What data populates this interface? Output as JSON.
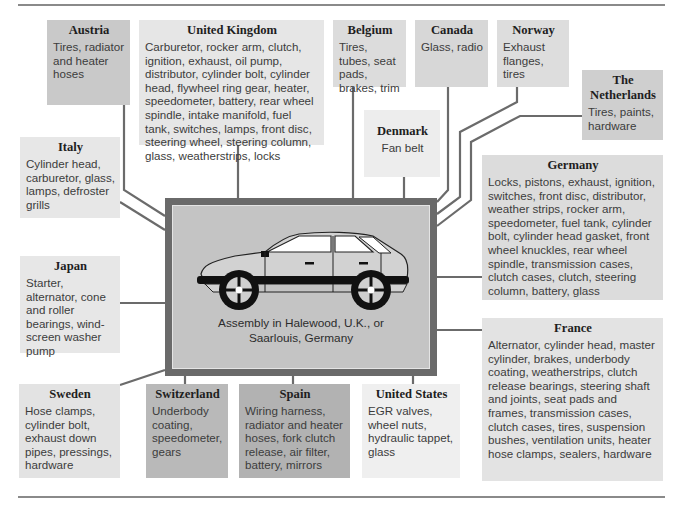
{
  "diagram": {
    "type": "supplier-map",
    "center": {
      "illustration": "hatchback-car",
      "caption_line1": "Assembly in Halewood, U.K., or",
      "caption_line2": "Saarlouis, Germany"
    },
    "suppliers": [
      {
        "id": "austria",
        "country": "Austria",
        "parts": "Tires, radiator and heater hoses",
        "shade": "#c9c9c9"
      },
      {
        "id": "uk",
        "country": "United Kingdom",
        "parts": "Carburetor, rocker arm, clutch, ignition, exhaust, oil pump, distributor, cylinder bolt, cylinder head, flywheel ring gear, heater, speedometer, battery, rear wheel spindle, intake manifold, fuel tank, switches, lamps, front disc, steering wheel, steering column, glass, weatherstrips, locks",
        "shade": "#e6e6e6"
      },
      {
        "id": "belgium",
        "country": "Belgium",
        "parts": "Tires, tubes, seat pads, brakes, trim",
        "shade": "#dcdcdc"
      },
      {
        "id": "canada",
        "country": "Canada",
        "parts": "Glass, radio",
        "shade": "#d7d7d7"
      },
      {
        "id": "norway",
        "country": "Norway",
        "parts": "Exhaust flanges, tires",
        "shade": "#dddddd"
      },
      {
        "id": "netherlands",
        "country": "The Netherlands",
        "parts": "Tires, paints, hardware",
        "shade": "#cfcfcf"
      },
      {
        "id": "denmark",
        "country": "Denmark",
        "parts": "Fan belt",
        "shade": "#ededed"
      },
      {
        "id": "italy",
        "country": "Italy",
        "parts": "Cylinder head, carburetor, glass, lamps, defroster grills",
        "shade": "#e7e7e7"
      },
      {
        "id": "germany",
        "country": "Germany",
        "parts": "Locks, pistons, exhaust, ignition, switches, front disc, distributor, weather strips, rocker arm, speedometer, fuel tank, cylinder bolt, cylinder head gasket, front wheel knuckles, rear wheel spindle, transmission cases, clutch cases, clutch, steering column, battery, glass",
        "shade": "#dcdcdc"
      },
      {
        "id": "japan",
        "country": "Japan",
        "parts": "Starter, alternator, cone and roller bearings, wind-screen washer pump",
        "shade": "#e7e7e7"
      },
      {
        "id": "france",
        "country": "France",
        "parts": "Alternator, cylinder head, master cylinder, brakes, underbody coating, weatherstrips, clutch release bearings, steering shaft and joints, seat pads and frames, transmission cases, clutch cases, tires, suspension bushes, ventilation units, heater hose clamps, sealers, hardware",
        "shade": "#e3e3e3"
      },
      {
        "id": "sweden",
        "country": "Sweden",
        "parts": "Hose clamps, cylinder bolt, exhaust down pipes, pressings, hardware",
        "shade": "#e3e3e3"
      },
      {
        "id": "switzerland",
        "country": "Switzerland",
        "parts": "Underbody coating, speedometer, gears",
        "shade": "#b9b9b9"
      },
      {
        "id": "spain",
        "country": "Spain",
        "parts": "Wiring harness, radiator and heater hoses, fork clutch release, air filter, battery, mirrors",
        "shade": "#b2b2b2"
      },
      {
        "id": "us",
        "country": "United States",
        "parts": "EGR valves, wheel nuts, hydraulic tappet, glass",
        "shade": "#efefef"
      }
    ]
  }
}
